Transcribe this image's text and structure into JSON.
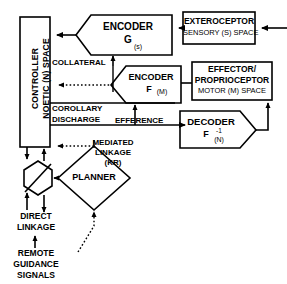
{
  "diagram": {
    "stroke_color": "#000000",
    "fill_color": "#ffffff",
    "nodes": {
      "controller": {
        "shape": "rectangle-vertical",
        "line1": "CONTROLLER",
        "line2": "NOETIC (N) SPACE"
      },
      "encoder_g": {
        "shape": "pentagon-left-point",
        "line1": "ENCODER",
        "line2": "G",
        "sub": "(s)"
      },
      "exteroceptor": {
        "shape": "rectangle",
        "line1": "EXTEROCEPTOR",
        "line2": "SENSORY (S) SPACE"
      },
      "encoder_f": {
        "shape": "pentagon-left-point",
        "line1": "ENCODER",
        "line2": "F",
        "sub": "(M)"
      },
      "effector": {
        "shape": "rectangle",
        "line1": "EFFECTOR/",
        "line2": "PROPRIOCEPTOR",
        "line3": "MOTOR (M) SPACE"
      },
      "decoder": {
        "shape": "pentagon-right-point",
        "line1": "DECODER",
        "line2": "F",
        "sup": "-1",
        "sub": "(N)"
      },
      "planner": {
        "shape": "diamond",
        "label": "PLANNER"
      },
      "summing_node": {
        "shape": "hexagon-with-diagonal",
        "label": ""
      }
    },
    "edge_labels": {
      "collateral": "COLLATERAL",
      "corollary": "COROLLARY",
      "discharge": "DISCHARGE",
      "efference": "EFFERENCE",
      "mediated_linkage_1": "MEDIATED",
      "mediated_linkage_2": "LINKAGE",
      "mediated_linkage_3": "(KR)",
      "direct_linkage_1": "DIRECT",
      "direct_linkage_2": "LINKAGE",
      "remote_1": "REMOTE",
      "remote_2": "GUIDANCE",
      "remote_3": "SIGNALS"
    }
  }
}
